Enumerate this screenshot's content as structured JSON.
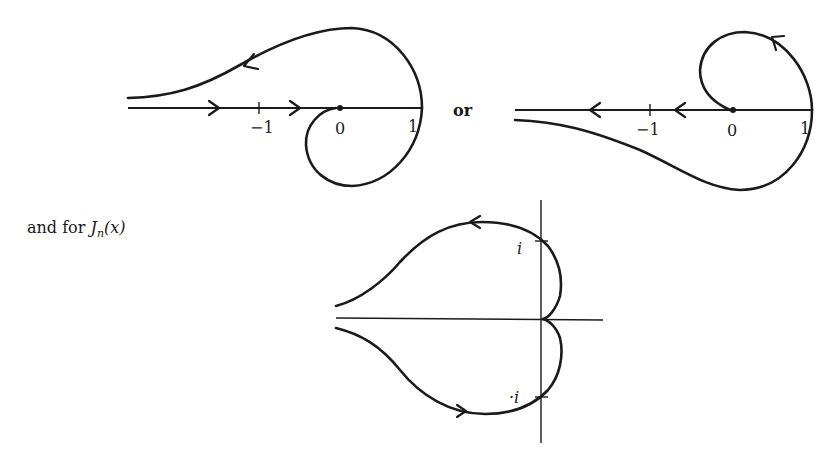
{
  "figure": {
    "left_contour": {
      "tick_labels": [
        "−1",
        "0",
        "1"
      ],
      "description": "Contour from −∞ along real axis to 0, loops below to 1, returns above to −∞"
    },
    "separator": "or",
    "right_contour": {
      "tick_labels": [
        "−1",
        "0",
        "1"
      ],
      "description": "Contour from 0 looping above to 1, returns below to −∞, with arrows along real axis pointing left"
    },
    "caption": {
      "prefix": "and for ",
      "func": "J",
      "subscript": "n",
      "arg": "(x)"
    },
    "bessel_contour": {
      "labels": {
        "upper": "i",
        "lower": "·i"
      }
    }
  }
}
